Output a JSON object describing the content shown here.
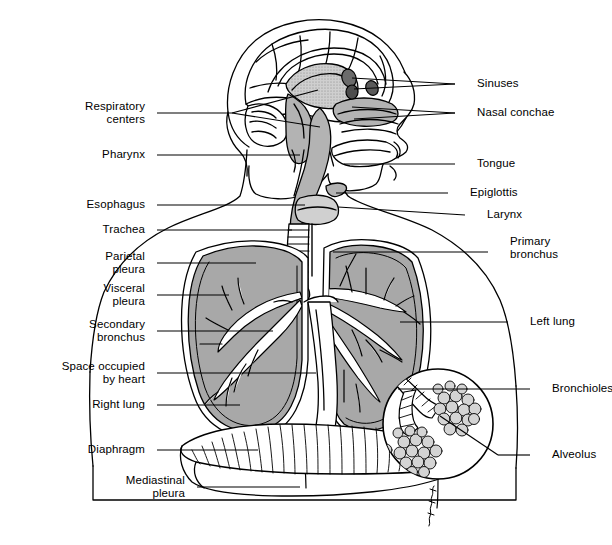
{
  "figure": {
    "signature": "Sinnett",
    "colors": {
      "background": "#ffffff",
      "ink": "#000000",
      "tissue_fill": "#b3b3b3",
      "organ_fill": "#a8a8a8",
      "light_fill": "#d8d8d8",
      "white_fill": "#ffffff"
    }
  },
  "labels_left": [
    {
      "id": "respiratory-centers",
      "text": "Respiratory\ncenters",
      "x": 145,
      "y": 113,
      "line_x2": 232
    },
    {
      "id": "pharynx",
      "text": "Pharynx",
      "x": 145,
      "y": 155,
      "line_x2": 300
    },
    {
      "id": "esophagus",
      "text": "Esophagus",
      "x": 145,
      "y": 205,
      "line_x2": 305
    },
    {
      "id": "trachea",
      "text": "Trachea",
      "x": 145,
      "y": 230,
      "line_x2": 292
    },
    {
      "id": "parietal-pleura",
      "text": "Parietal\npleura",
      "x": 145,
      "y": 263,
      "line_x2": 256
    },
    {
      "id": "visceral-pleura",
      "text": "Visceral\npleura",
      "x": 145,
      "y": 295,
      "line_x2": 229
    },
    {
      "id": "secondary-bronchus",
      "text": "Secondary\nbronchus",
      "x": 145,
      "y": 331,
      "line_x2": 273
    },
    {
      "id": "space-occupied-by-heart",
      "text": "Space occupied\nby heart",
      "x": 145,
      "y": 373,
      "line_x2": 316
    },
    {
      "id": "right-lung",
      "text": "Right lung",
      "x": 145,
      "y": 405,
      "line_x2": 240
    },
    {
      "id": "diaphragm",
      "text": "Diaphragm",
      "x": 145,
      "y": 450,
      "line_x2": 258
    },
    {
      "id": "mediastinal-pleura",
      "text": "Mediastinal\npleura",
      "x": 185,
      "y": 487,
      "line_x2": 300
    }
  ],
  "labels_right": [
    {
      "id": "sinuses",
      "text": "Sinuses",
      "x": 477,
      "y": 84,
      "line_x1": 455
    },
    {
      "id": "nasal-conchae",
      "text": "Nasal conchae",
      "x": 477,
      "y": 113,
      "line_x1": 455
    },
    {
      "id": "tongue",
      "text": "Tongue",
      "x": 477,
      "y": 164,
      "line_x1": 455
    },
    {
      "id": "epiglottis",
      "text": "Epiglottis",
      "x": 470,
      "y": 193,
      "line_x1": 448
    },
    {
      "id": "larynx",
      "text": "Larynx",
      "x": 487,
      "y": 215,
      "line_x1": 465
    },
    {
      "id": "primary-bronchus",
      "text": "Primary\nbronchus",
      "x": 510,
      "y": 248,
      "line_x1": 488
    },
    {
      "id": "left-lung",
      "text": "Left lung",
      "x": 530,
      "y": 322,
      "line_x1": 508
    },
    {
      "id": "bronchioles",
      "text": "Bronchioles",
      "x": 552,
      "y": 389,
      "line_x1": 530
    },
    {
      "id": "alveolus",
      "text": "Alveolus",
      "x": 552,
      "y": 455,
      "line_x1": 530
    }
  ],
  "leader_lines_left": [
    {
      "for": "respiratory-centers",
      "x1": 157,
      "y1": 113,
      "x2": 232,
      "y2": 113
    },
    {
      "for": "respiratory-centers-fork-a",
      "x1": 232,
      "y1": 113,
      "x2": 320,
      "y2": 88
    },
    {
      "for": "respiratory-centers-fork-b",
      "x1": 232,
      "y1": 113,
      "x2": 322,
      "y2": 126
    },
    {
      "for": "pharynx",
      "x1": 157,
      "y1": 155,
      "x2": 300,
      "y2": 155
    },
    {
      "for": "esophagus",
      "x1": 157,
      "y1": 205,
      "x2": 305,
      "y2": 205
    },
    {
      "for": "trachea",
      "x1": 157,
      "y1": 230,
      "x2": 292,
      "y2": 230
    },
    {
      "for": "parietal-pleura",
      "x1": 157,
      "y1": 263,
      "x2": 256,
      "y2": 263
    },
    {
      "for": "visceral-pleura",
      "x1": 157,
      "y1": 295,
      "x2": 229,
      "y2": 295
    },
    {
      "for": "secondary-bronchus",
      "x1": 157,
      "y1": 331,
      "x2": 273,
      "y2": 331
    },
    {
      "for": "space-occupied-by-heart",
      "x1": 157,
      "y1": 373,
      "x2": 316,
      "y2": 373
    },
    {
      "for": "right-lung",
      "x1": 157,
      "y1": 405,
      "x2": 240,
      "y2": 405
    },
    {
      "for": "diaphragm",
      "x1": 157,
      "y1": 450,
      "x2": 258,
      "y2": 450
    },
    {
      "for": "mediastinal-pleura",
      "x1": 197,
      "y1": 487,
      "x2": 300,
      "y2": 487
    }
  ],
  "leader_lines_right": [
    {
      "for": "sinuses",
      "x1": 455,
      "y1": 84,
      "x2": 352,
      "y2": 78
    },
    {
      "for": "sinuses-fork",
      "x1": 455,
      "y1": 84,
      "x2": 352,
      "y2": 88
    },
    {
      "for": "nasal-conchae",
      "x1": 455,
      "y1": 113,
      "x2": 352,
      "y2": 108
    },
    {
      "for": "nasal-conchae-fork",
      "x1": 455,
      "y1": 113,
      "x2": 352,
      "y2": 118
    },
    {
      "for": "tongue",
      "x1": 455,
      "y1": 164,
      "x2": 340,
      "y2": 164
    },
    {
      "for": "epiglottis",
      "x1": 448,
      "y1": 193,
      "x2": 338,
      "y2": 193
    },
    {
      "for": "larynx",
      "x1": 465,
      "y1": 215,
      "x2": 338,
      "y2": 207
    },
    {
      "for": "primary-bronchus",
      "x1": 488,
      "y1": 252,
      "x2": 333,
      "y2": 252
    },
    {
      "for": "left-lung",
      "x1": 508,
      "y1": 322,
      "x2": 400,
      "y2": 322
    },
    {
      "for": "bronchioles",
      "x1": 530,
      "y1": 389,
      "x2": 398,
      "y2": 389
    },
    {
      "for": "alveolus",
      "x1": 530,
      "y1": 455,
      "x2": 498,
      "y2": 455
    },
    {
      "for": "alveolus-tail",
      "x1": 498,
      "y1": 455,
      "x2": 438,
      "y2": 418
    }
  ],
  "anatomy_parts": [
    "cranium",
    "cerebrum",
    "corpus-callosum",
    "cerebellum",
    "brainstem",
    "nasal-cavity",
    "sinuses",
    "nasal-conchae",
    "tongue",
    "pharynx",
    "epiglottis",
    "larynx",
    "esophagus",
    "trachea",
    "primary-bronchus",
    "secondary-bronchus",
    "right-lung",
    "left-lung",
    "bronchial-tree",
    "parietal-pleura",
    "visceral-pleura",
    "mediastinal-pleura",
    "space-occupied-by-heart",
    "diaphragm",
    "alveolus-inset",
    "bronchioles",
    "alveolar-sacs",
    "torso-outline",
    "shoulders",
    "neck"
  ]
}
